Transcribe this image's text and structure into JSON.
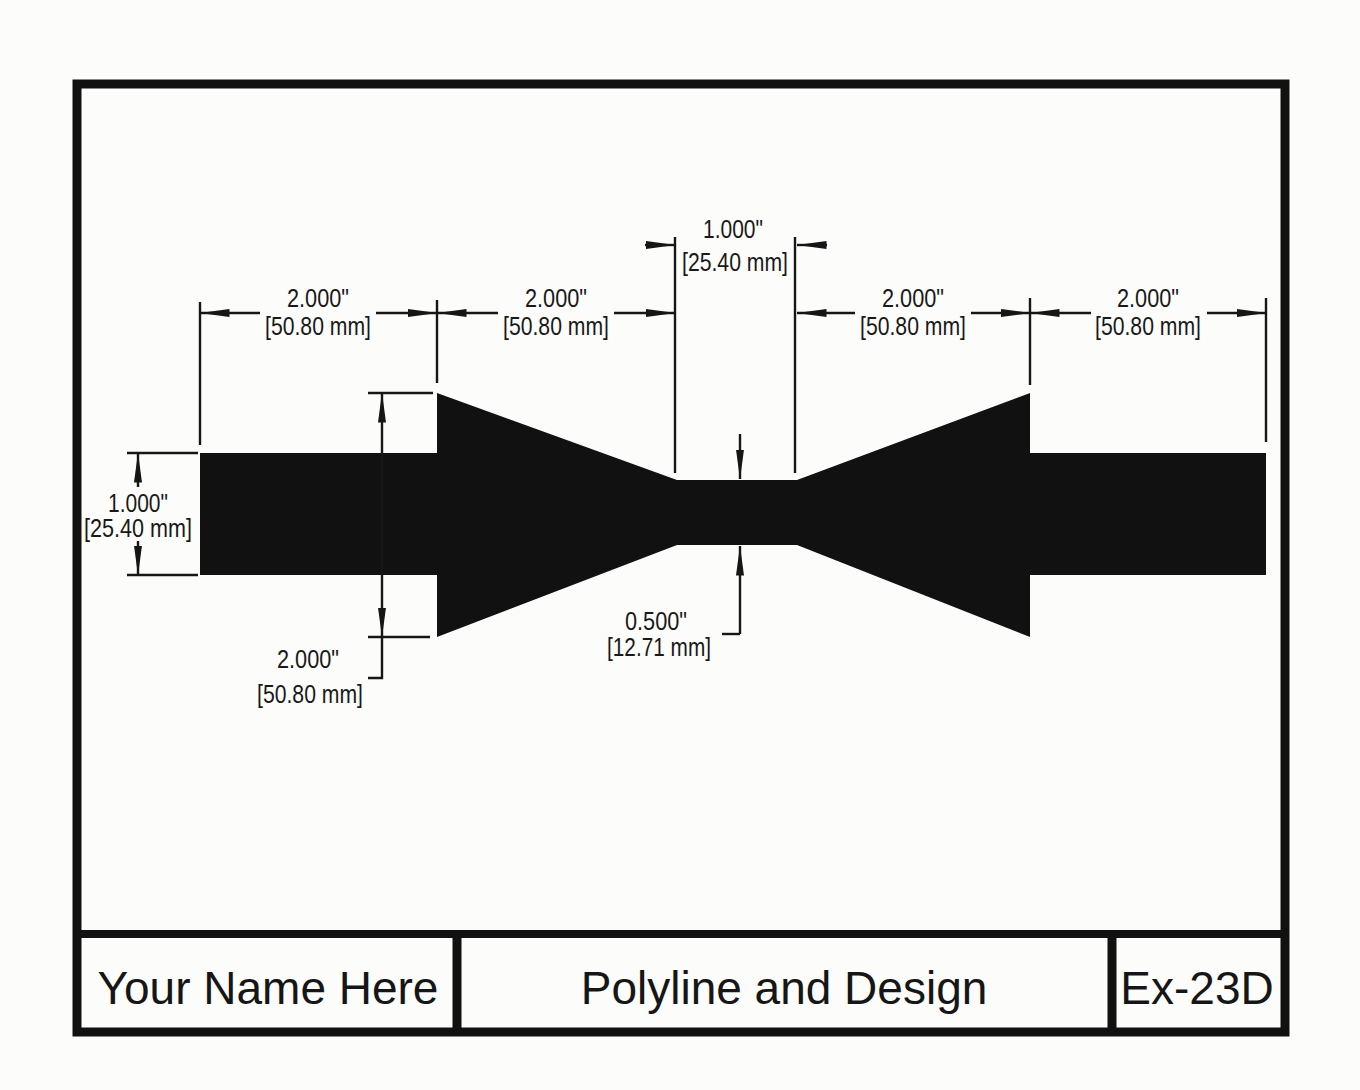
{
  "page": {
    "paper_color": "#fcfcfb",
    "ink_color": "#161616"
  },
  "title_block": {
    "name": "Your Name Here",
    "drawing_title": "Polyline and Design",
    "exercise_number": "Ex-23D"
  },
  "dimensions": {
    "width_far_left": {
      "inches": "2.000\"",
      "metric": "[50.80 mm]"
    },
    "width_mid_left": {
      "inches": "2.000\"",
      "metric": "[50.80 mm]"
    },
    "width_neck": {
      "inches": "1.000\"",
      "metric": "[25.40 mm]"
    },
    "width_mid_right": {
      "inches": "2.000\"",
      "metric": "[50.80 mm]"
    },
    "width_far_right": {
      "inches": "2.000\"",
      "metric": "[50.80 mm]"
    },
    "height_bar": {
      "inches": "1.000\"",
      "metric": "[25.40 mm]"
    },
    "height_flare": {
      "inches": "2.000\"",
      "metric": "[50.80 mm]"
    },
    "height_neck": {
      "inches": "0.500\"",
      "metric": "[12.71 mm]"
    }
  }
}
